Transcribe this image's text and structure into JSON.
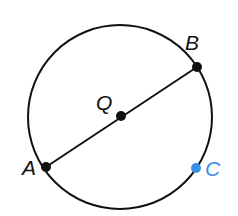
{
  "diagram": {
    "type": "circle-with-diameter",
    "colors": {
      "stroke": "#111111",
      "point": "#111111",
      "highlight": "#3a8ee6",
      "background": "#ffffff"
    },
    "circle": {
      "center_label": "Q",
      "cx": 120,
      "cy": 117,
      "r": 92
    },
    "segments": [
      {
        "from": "A",
        "to": "B",
        "kind": "diameter"
      }
    ],
    "points": [
      {
        "label": "A",
        "x": 46,
        "y": 167,
        "color": "#111111",
        "label_x": 22,
        "label_y": 175
      },
      {
        "label": "B",
        "x": 197,
        "y": 67,
        "color": "#111111",
        "label_x": 185,
        "label_y": 50
      },
      {
        "label": "Q",
        "x": 121,
        "y": 116,
        "color": "#111111",
        "label_x": 96,
        "label_y": 110
      },
      {
        "label": "C",
        "x": 196,
        "y": 168,
        "color": "#3a8ee6",
        "label_x": 205,
        "label_y": 176
      }
    ]
  }
}
